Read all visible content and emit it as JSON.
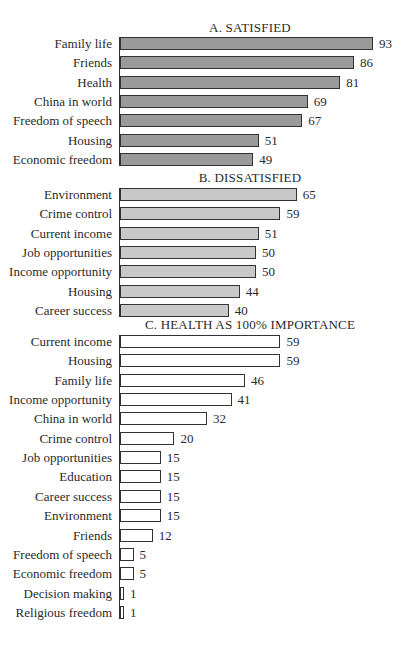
{
  "chart_data": [
    {
      "type": "bar",
      "orientation": "horizontal",
      "title": "A. SATISFIED",
      "categories": [
        "Family life",
        "Friends",
        "Health",
        "China in world",
        "Freedom of speech",
        "Housing",
        "Economic freedom"
      ],
      "values": [
        93,
        86,
        81,
        69,
        67,
        51,
        49
      ],
      "bar_color": "#9a9a9a",
      "xlabel": "",
      "ylabel": "",
      "grid": false
    },
    {
      "type": "bar",
      "orientation": "horizontal",
      "title": "B. DISSATISFIED",
      "categories": [
        "Environment",
        "Crime control",
        "Current income",
        "Job opportunities",
        "Income opportunity",
        "Housing",
        "Career success"
      ],
      "values": [
        65,
        59,
        51,
        50,
        50,
        44,
        40
      ],
      "bar_color": "#c8c8c8",
      "xlabel": "",
      "ylabel": "",
      "grid": false
    },
    {
      "type": "bar",
      "orientation": "horizontal",
      "title": "C. HEALTH AS 100% IMPORTANCE",
      "categories": [
        "Current income",
        "Housing",
        "Family life",
        "Income opportunity",
        "China in world",
        "Crime control",
        "Job opportunities",
        "Education",
        "Career success",
        "Environment",
        "Friends",
        "Freedom of speech",
        "Economic freedom",
        "Decision making",
        "Religious freedom"
      ],
      "values": [
        59,
        59,
        46,
        41,
        32,
        20,
        15,
        15,
        15,
        15,
        12,
        5,
        5,
        1,
        1
      ],
      "bar_color": "#ffffff",
      "xlabel": "",
      "ylabel": "",
      "grid": false
    }
  ],
  "panels": {
    "a": {
      "title": "A. SATISFIED"
    },
    "b": {
      "title": "B. DISSATISFIED"
    },
    "c": {
      "title": "C. HEALTH AS 100% IMPORTANCE"
    }
  }
}
